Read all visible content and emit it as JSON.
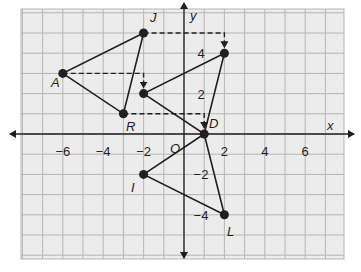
{
  "diagram": {
    "type": "coordinate-plane",
    "colors": {
      "background": "#ffffff",
      "grid_fill": "#ececec",
      "grid_line": "#b5b5b5",
      "axis": "#231f20",
      "segment": "#231f20",
      "dashed": "#231f20",
      "point": "#231f20"
    },
    "axes": {
      "x_label": "x",
      "y_label": "y",
      "origin_label": "O",
      "x_ticks": [
        {
          "value": -6,
          "label": "−6"
        },
        {
          "value": -4,
          "label": "−4"
        },
        {
          "value": -2,
          "label": "−2"
        },
        {
          "value": 2,
          "label": "2"
        },
        {
          "value": 4,
          "label": "4"
        },
        {
          "value": 6,
          "label": "6"
        }
      ],
      "y_ticks": [
        {
          "value": 4,
          "label": "4"
        },
        {
          "value": 2,
          "label": "2"
        },
        {
          "value": -2,
          "label": "−2"
        },
        {
          "value": -4,
          "label": "−4"
        }
      ]
    },
    "points": {
      "A": {
        "label": "A",
        "x": -6,
        "y": 3
      },
      "J": {
        "label": "J",
        "x": -2,
        "y": 5
      },
      "R": {
        "label": "R",
        "x": -3,
        "y": 1
      },
      "D": {
        "label": "D",
        "x": 1,
        "y": 0
      },
      "P1": {
        "label": "",
        "x": 2,
        "y": 4
      },
      "P2": {
        "label": "",
        "x": -2,
        "y": 2
      },
      "I": {
        "label": "I",
        "x": -2,
        "y": -2
      },
      "L": {
        "label": "L",
        "x": 2,
        "y": -4
      }
    },
    "triangles": [
      {
        "name": "JAR",
        "vertices": [
          "J",
          "A",
          "R"
        ]
      },
      {
        "name": "image",
        "vertices": [
          "P1",
          "P2",
          "D"
        ]
      },
      {
        "name": "DIL",
        "vertices": [
          "D",
          "I",
          "L"
        ]
      }
    ],
    "translation_arrows": [
      {
        "from": "A",
        "to": "P2"
      },
      {
        "from": "J",
        "to": "P1"
      },
      {
        "from": "R",
        "to": "D"
      }
    ]
  }
}
